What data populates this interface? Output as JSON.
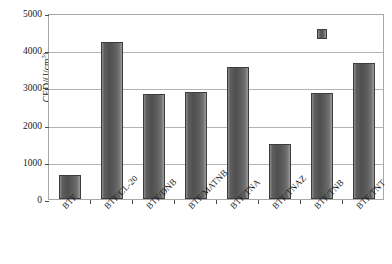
{
  "chart_data": {
    "type": "bar",
    "title": "",
    "xlabel": "",
    "ylabel": "CED/(J/cm",
    "ylabel_sup": "3",
    "ylabel_tail": ")",
    "categories": [
      "BTF",
      "BTF/CL-20",
      "BTF/DNB",
      "BTF/MATNB",
      "BTF/TNA",
      "BTF/TNAZ",
      "BTF/TNB",
      "BTF/TNT"
    ],
    "values": [
      640,
      4230,
      2820,
      2890,
      3560,
      1470,
      2850,
      3660
    ],
    "ylim": [
      0,
      5000
    ],
    "yticks": [
      0,
      1000,
      2000,
      3000,
      4000,
      5000
    ],
    "ytick_labels": [
      "0",
      "1000",
      "2000",
      "3000",
      "4000",
      "5000"
    ],
    "grid": true,
    "legend": "none",
    "bar_color": "#555555",
    "grid_color": "#b3b3b3",
    "axis_color": "#a8a8a8",
    "annotations": [
      {
        "name": "outlier-marker",
        "shape": "square",
        "category": "BTF/TNB",
        "value": 4500
      }
    ]
  }
}
